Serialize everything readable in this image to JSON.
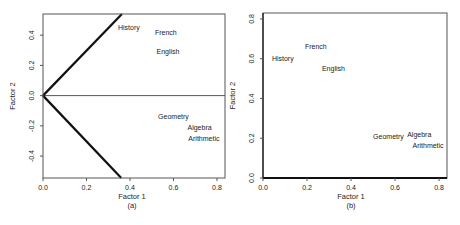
{
  "chart_data": [
    {
      "panel": "(a)",
      "type": "scatter",
      "title": "",
      "xlabel": "Factor 1",
      "ylabel": "Factor 2",
      "caption": "(a)",
      "xlim": [
        0.0,
        0.837
      ],
      "ylim": [
        -0.545,
        0.54
      ],
      "xticks": [
        0.0,
        0.2,
        0.4,
        0.6,
        0.8
      ],
      "xtick_labels": [
        "0.0",
        "0.2",
        "0.4",
        "0.6",
        "0.8"
      ],
      "yticks": [
        -0.4,
        -0.2,
        0.0,
        0.2,
        0.4
      ],
      "ytick_labels": [
        "-0.4",
        "-0.2",
        "0.0",
        "0.2",
        "0.4"
      ],
      "grid": false,
      "points": [
        {
          "label": "History",
          "x": 0.395,
          "y": 0.45
        },
        {
          "label": "French",
          "x": 0.565,
          "y": 0.42
        },
        {
          "label": "English",
          "x": 0.575,
          "y": 0.29
        },
        {
          "label": "Geometry",
          "x": 0.6,
          "y": -0.14
        },
        {
          "label": "Algebra",
          "x": 0.72,
          "y": -0.21
        },
        {
          "label": "Arithmetic",
          "x": 0.74,
          "y": -0.285
        }
      ],
      "reference_lines": [
        {
          "name": "horizontal-zero-line",
          "x1": 0.0,
          "y1": 0.0,
          "x2": 0.837,
          "y2": 0.0,
          "width": 1
        },
        {
          "name": "rotated-axis-upper",
          "x1": 0.0,
          "y1": 0.0,
          "x2": 0.363,
          "y2": 0.54,
          "width": 2.2
        },
        {
          "name": "rotated-axis-lower",
          "x1": 0.0,
          "y1": 0.0,
          "x2": 0.36,
          "y2": -0.545,
          "width": 2.2
        }
      ]
    },
    {
      "panel": "(b)",
      "type": "scatter",
      "title": "",
      "xlabel": "Factor 1",
      "ylabel": "Factor 2",
      "caption": "(b)",
      "xlim": [
        0.0,
        0.836
      ],
      "ylim": [
        0.0,
        0.83
      ],
      "xticks": [
        0.0,
        0.2,
        0.4,
        0.6,
        0.8
      ],
      "xtick_labels": [
        "0.0",
        "0.2",
        "0.4",
        "0.6",
        "0.8"
      ],
      "yticks": [
        0.0,
        0.2,
        0.4,
        0.6,
        0.8
      ],
      "ytick_labels": [
        "0.0",
        "0.2",
        "0.4",
        "0.6",
        "0.8"
      ],
      "grid": false,
      "points": [
        {
          "label": "French",
          "x": 0.24,
          "y": 0.66
        },
        {
          "label": "History",
          "x": 0.09,
          "y": 0.6
        },
        {
          "label": "English",
          "x": 0.32,
          "y": 0.55
        },
        {
          "label": "Geometry",
          "x": 0.57,
          "y": 0.21
        },
        {
          "label": "Algebra",
          "x": 0.71,
          "y": 0.22
        },
        {
          "label": "Arithmetic",
          "x": 0.75,
          "y": 0.165
        }
      ],
      "reference_lines": []
    }
  ],
  "style": {
    "frame_color": "#555555",
    "thick_line_color": "#111111",
    "text_color": "#222222",
    "background": "#ffffff"
  }
}
